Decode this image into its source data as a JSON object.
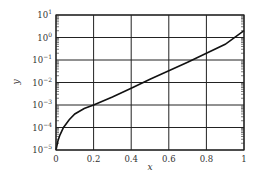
{
  "chart_data": {
    "type": "line",
    "title": "",
    "xlabel": "x",
    "ylabel": "y",
    "xlim": [
      0,
      1
    ],
    "ylim": [
      1e-05,
      10
    ],
    "yscale": "log",
    "grid": true,
    "legend": null,
    "x_ticks": [
      "0",
      "0.2",
      "0.4",
      "0.6",
      "0.8",
      "1"
    ],
    "x_tick_values": [
      0,
      0.2,
      0.4,
      0.6,
      0.8,
      1
    ],
    "y_ticks": [
      {
        "base": "10",
        "exp": "1",
        "value": 10
      },
      {
        "base": "10",
        "exp": "0",
        "value": 1
      },
      {
        "base": "10",
        "exp": "−1",
        "value": 0.1
      },
      {
        "base": "10",
        "exp": "−2",
        "value": 0.01
      },
      {
        "base": "10",
        "exp": "−3",
        "value": 0.001
      },
      {
        "base": "10",
        "exp": "−4",
        "value": 0.0001
      },
      {
        "base": "10",
        "exp": "−5",
        "value": 1e-05
      }
    ],
    "series": [
      {
        "name": "y",
        "color": "#111111",
        "x": [
          0.0,
          0.01,
          0.02,
          0.04,
          0.07,
          0.1,
          0.15,
          0.2,
          0.3,
          0.4,
          0.5,
          0.6,
          0.7,
          0.8,
          0.9,
          1.0
        ],
        "y": [
          1e-05,
          2.5e-05,
          4.5e-05,
          0.0001,
          0.00022,
          0.0004,
          0.0007,
          0.001,
          0.0023,
          0.0055,
          0.014,
          0.033,
          0.08,
          0.2,
          0.5,
          2.0
        ]
      }
    ]
  },
  "axes": {
    "xlabel": "x",
    "ylabel": "y"
  }
}
